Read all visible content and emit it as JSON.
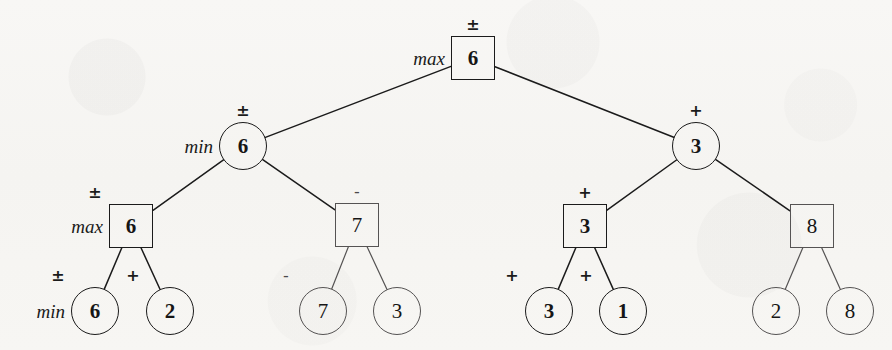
{
  "figure": {
    "background_color": "#f7f6f4",
    "stroke_color": "#1b1b1b",
    "light_stroke_color": "#555353"
  },
  "nodes": [
    {
      "id": "root",
      "value": "6",
      "shape": "square",
      "weight": "bold",
      "op": "±",
      "op_weight": "bold",
      "side_label": "max",
      "x": 473,
      "y": 58,
      "size": 44
    },
    {
      "id": "n-l",
      "value": "6",
      "shape": "circle",
      "weight": "bold",
      "op": "±",
      "op_weight": "bold",
      "side_label": "min",
      "x": 243,
      "y": 146,
      "size": 48
    },
    {
      "id": "n-r",
      "value": "3",
      "shape": "circle",
      "weight": "bold",
      "op": "+",
      "op_weight": "bold",
      "side_label": "",
      "x": 696,
      "y": 146,
      "size": 48
    },
    {
      "id": "n-ll",
      "value": "6",
      "shape": "square",
      "weight": "bold",
      "op": "±",
      "op_weight": "bold",
      "side_label": "max",
      "x": 131,
      "y": 226,
      "size": 44
    },
    {
      "id": "n-lr",
      "value": "7",
      "shape": "square",
      "weight": "light",
      "op": "-",
      "op_weight": "light",
      "side_label": "",
      "x": 357,
      "y": 225,
      "size": 44
    },
    {
      "id": "n-rl",
      "value": "3",
      "shape": "square",
      "weight": "bold",
      "op": "+",
      "op_weight": "bold",
      "side_label": "",
      "x": 585,
      "y": 226,
      "size": 44
    },
    {
      "id": "n-rr",
      "value": "8",
      "shape": "square",
      "weight": "light",
      "op": "",
      "op_weight": "light",
      "side_label": "",
      "x": 812,
      "y": 226,
      "size": 44
    },
    {
      "id": "leaf-1",
      "value": "6",
      "shape": "circle",
      "weight": "bold",
      "op": "±",
      "op_weight": "bold",
      "side_label": "min",
      "x": 95,
      "y": 311,
      "size": 48
    },
    {
      "id": "leaf-2",
      "value": "2",
      "shape": "circle",
      "weight": "bold",
      "op": "+",
      "op_weight": "bold",
      "side_label": "",
      "x": 170,
      "y": 311,
      "size": 48
    },
    {
      "id": "leaf-3",
      "value": "7",
      "shape": "circle",
      "weight": "light",
      "op": "-",
      "op_weight": "light",
      "side_label": "",
      "x": 323,
      "y": 311,
      "size": 48
    },
    {
      "id": "leaf-4",
      "value": "3",
      "shape": "circle",
      "weight": "light",
      "op": "",
      "op_weight": "light",
      "side_label": "",
      "x": 397,
      "y": 311,
      "size": 48
    },
    {
      "id": "leaf-5",
      "value": "3",
      "shape": "circle",
      "weight": "bold",
      "op": "+",
      "op_weight": "bold",
      "side_label": "",
      "x": 549,
      "y": 311,
      "size": 48
    },
    {
      "id": "leaf-6",
      "value": "1",
      "shape": "circle",
      "weight": "bold",
      "op": "+",
      "op_weight": "bold",
      "side_label": "",
      "x": 623,
      "y": 311,
      "size": 48
    },
    {
      "id": "leaf-7",
      "value": "2",
      "shape": "circle",
      "weight": "light",
      "op": "",
      "op_weight": "light",
      "side_label": "",
      "x": 776,
      "y": 311,
      "size": 48
    },
    {
      "id": "leaf-8",
      "value": "8",
      "shape": "circle",
      "weight": "light",
      "op": "",
      "op_weight": "light",
      "side_label": "",
      "x": 850,
      "y": 311,
      "size": 48
    }
  ],
  "edges": [
    {
      "from": "root",
      "to": "n-l",
      "weight": "bold"
    },
    {
      "from": "root",
      "to": "n-r",
      "weight": "bold"
    },
    {
      "from": "n-l",
      "to": "n-ll",
      "weight": "bold"
    },
    {
      "from": "n-l",
      "to": "n-lr",
      "weight": "bold"
    },
    {
      "from": "n-r",
      "to": "n-rl",
      "weight": "bold"
    },
    {
      "from": "n-r",
      "to": "n-rr",
      "weight": "bold"
    },
    {
      "from": "n-ll",
      "to": "leaf-1",
      "weight": "bold"
    },
    {
      "from": "n-ll",
      "to": "leaf-2",
      "weight": "bold"
    },
    {
      "from": "n-lr",
      "to": "leaf-3",
      "weight": "light"
    },
    {
      "from": "n-lr",
      "to": "leaf-4",
      "weight": "light"
    },
    {
      "from": "n-rl",
      "to": "leaf-5",
      "weight": "bold"
    },
    {
      "from": "n-rl",
      "to": "leaf-6",
      "weight": "bold"
    },
    {
      "from": "n-rr",
      "to": "leaf-7",
      "weight": "light"
    },
    {
      "from": "n-rr",
      "to": "leaf-8",
      "weight": "light"
    }
  ]
}
